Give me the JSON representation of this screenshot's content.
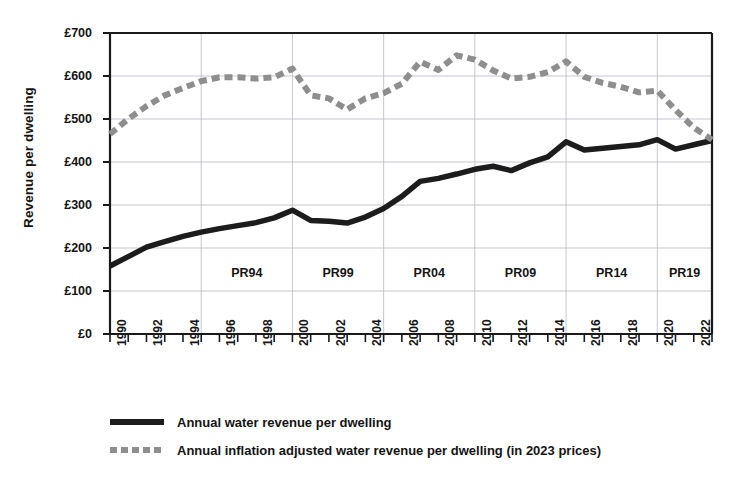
{
  "chart_data": {
    "type": "line",
    "title": "",
    "subtitle": "",
    "xlabel": "",
    "ylabel": "Revenue per dwelling",
    "xlim": [
      1990,
      2023
    ],
    "ylim": [
      0,
      700
    ],
    "y_tick_labels": [
      "£0",
      "£100",
      "£200",
      "£300",
      "£400",
      "£500",
      "£600",
      "£700"
    ],
    "y_tick_values": [
      0,
      100,
      200,
      300,
      400,
      500,
      600,
      700
    ],
    "x_tick_labels": [
      "1990",
      "1992",
      "1994",
      "1996",
      "1998",
      "2000",
      "2002",
      "2004",
      "2006",
      "2008",
      "2010",
      "2012",
      "2014",
      "2016",
      "2018",
      "2020",
      "2022"
    ],
    "x_tick_values": [
      1990,
      1992,
      1994,
      1996,
      1998,
      2000,
      2002,
      2004,
      2006,
      2008,
      2010,
      2012,
      2014,
      2016,
      2018,
      2020,
      2022
    ],
    "x": [
      1990,
      1991,
      1992,
      1993,
      1994,
      1995,
      1996,
      1997,
      1998,
      1999,
      2000,
      2001,
      2002,
      2003,
      2004,
      2005,
      2006,
      2007,
      2008,
      2009,
      2010,
      2011,
      2012,
      2013,
      2014,
      2015,
      2016,
      2017,
      2018,
      2019,
      2020,
      2021,
      2022,
      2023
    ],
    "grid": true,
    "grid_axis": "both",
    "legend_position": "below",
    "series": [
      {
        "name": "Annual water revenue per dwelling",
        "style": "solid",
        "color": "#1c1c1c",
        "values": [
          158,
          180,
          202,
          215,
          227,
          237,
          245,
          252,
          259,
          270,
          288,
          264,
          262,
          258,
          272,
          292,
          320,
          355,
          362,
          372,
          383,
          390,
          380,
          398,
          412,
          447,
          428,
          432,
          436,
          440,
          452,
          430,
          440,
          450
        ]
      },
      {
        "name": "Annual inflation adjusted water revenue per dwelling (in 2023 prices)",
        "style": "dashed",
        "color": "#8e8e8e",
        "values": [
          465,
          500,
          530,
          555,
          572,
          588,
          597,
          597,
          594,
          597,
          617,
          555,
          548,
          522,
          548,
          560,
          582,
          633,
          614,
          648,
          638,
          613,
          594,
          598,
          609,
          634,
          598,
          584,
          575,
          562,
          566,
          521,
          480,
          452
        ]
      }
    ],
    "annotations": [
      {
        "label": "PR94",
        "x_center": 1997.5
      },
      {
        "label": "PR99",
        "x_center": 2002.5
      },
      {
        "label": "PR04",
        "x_center": 2007.5
      },
      {
        "label": "PR09",
        "x_center": 2012.5
      },
      {
        "label": "PR14",
        "x_center": 2017.5
      },
      {
        "label": "PR19",
        "x_center": 2021.5
      }
    ],
    "period_boundaries": [
      1995,
      2000,
      2005,
      2010,
      2015,
      2020
    ]
  },
  "legend": {
    "items": [
      {
        "label": "Annual water revenue per dwelling",
        "style": "solid"
      },
      {
        "label": "Annual inflation adjusted water revenue per dwelling (in 2023 prices)",
        "style": "dashed"
      }
    ]
  },
  "colors": {
    "series_solid": "#1c1c1c",
    "series_dashed": "#8e8e8e",
    "axis": "#1a1a1a",
    "grid": "#b9b9c4",
    "background": "#ffffff"
  }
}
